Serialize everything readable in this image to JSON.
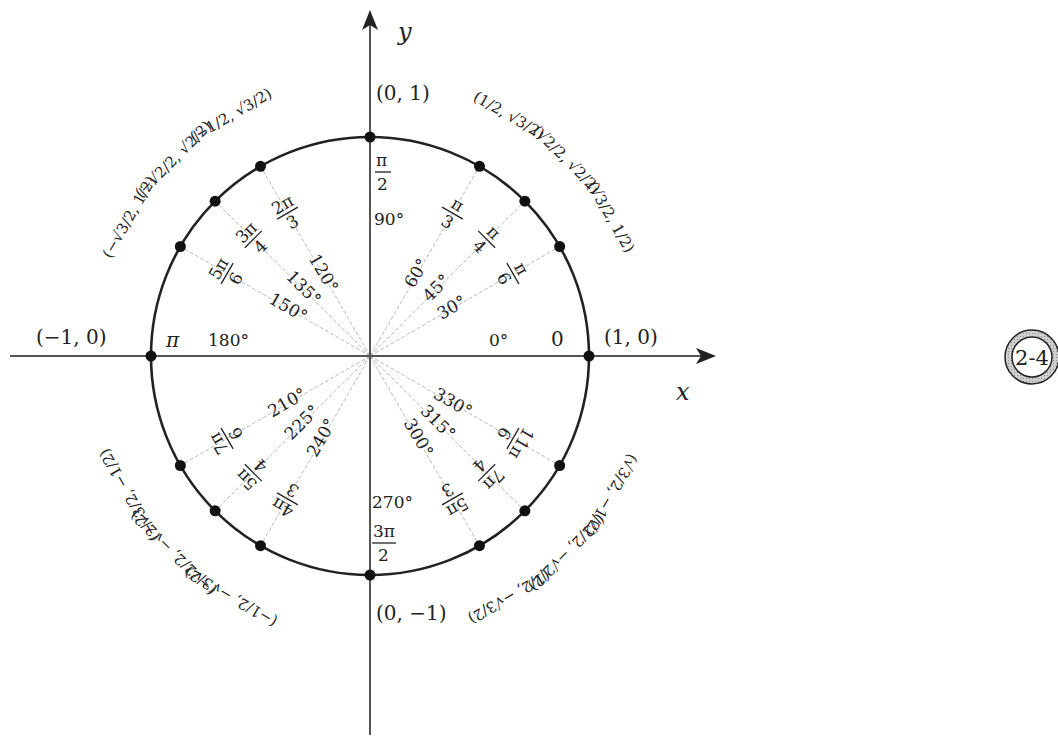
{
  "figure": {
    "axes": {
      "x_label": "x",
      "y_label": "y"
    },
    "badge": {
      "text": "2-4"
    },
    "geometry": {
      "cx": 370,
      "cy": 356,
      "r": 219
    },
    "cardinal": {
      "right": {
        "coord": "(1, 0)",
        "radian": "0",
        "degree": "0°"
      },
      "top": {
        "coord": "(0, 1)",
        "radian_num": "π",
        "radian_den": "2",
        "degree": "90°"
      },
      "left": {
        "coord": "(−1, 0)",
        "radian": "π",
        "degree": "180°"
      },
      "bottom": {
        "coord": "(0, −1)",
        "radian_num": "3π",
        "radian_den": "2",
        "degree": "270°"
      }
    },
    "angles": [
      {
        "deg": 30,
        "degree": "30°",
        "radian_num": "π",
        "radian_den": "6",
        "coord": "(√3/2, 1/2)"
      },
      {
        "deg": 45,
        "degree": "45°",
        "radian_num": "π",
        "radian_den": "4",
        "coord": "(√2/2, √2/2)"
      },
      {
        "deg": 60,
        "degree": "60°",
        "radian_num": "π",
        "radian_den": "3",
        "coord": "(1/2, √3/2)"
      },
      {
        "deg": 120,
        "degree": "120°",
        "radian_num": "2π",
        "radian_den": "3",
        "coord": "(−1/2, √3/2)"
      },
      {
        "deg": 135,
        "degree": "135°",
        "radian_num": "3π",
        "radian_den": "4",
        "coord": "(−√2/2, √2/2)"
      },
      {
        "deg": 150,
        "degree": "150°",
        "radian_num": "5π",
        "radian_den": "6",
        "coord": "(−√3/2, 1/2)"
      },
      {
        "deg": 210,
        "degree": "210°",
        "radian_num": "7π",
        "radian_den": "6",
        "coord": "(−√3/2, −1/2)"
      },
      {
        "deg": 225,
        "degree": "225°",
        "radian_num": "5π",
        "radian_den": "4",
        "coord": "(−√2/2, −√2/2)"
      },
      {
        "deg": 240,
        "degree": "240°",
        "radian_num": "4π",
        "radian_den": "3",
        "coord": "(−1/2, −√3/2)"
      },
      {
        "deg": 300,
        "degree": "300°",
        "radian_num": "5π",
        "radian_den": "3",
        "coord": "(1/2, −√3/2)"
      },
      {
        "deg": 315,
        "degree": "315°",
        "radian_num": "7π",
        "radian_den": "4",
        "coord": "(√2/2, −√2/2)"
      },
      {
        "deg": 330,
        "degree": "330°",
        "radian_num": "11π",
        "radian_den": "6",
        "coord": "(√3/2, −1/2)"
      }
    ]
  }
}
